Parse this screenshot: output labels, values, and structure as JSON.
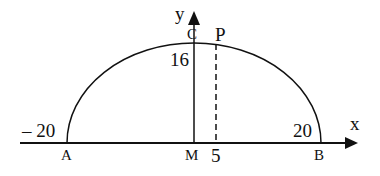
{
  "diagram": {
    "type": "semi-ellipse-on-axes",
    "axes": {
      "x_label": "x",
      "y_label": "y"
    },
    "points": {
      "A": "A",
      "B": "B",
      "C": "C",
      "M": "M",
      "P": "P"
    },
    "values": {
      "neg_twenty": "– 20",
      "twenty": "20",
      "sixteen": "16",
      "five": "5"
    },
    "semi_axis_x": 20,
    "semi_axis_y": 16,
    "p_x": 5
  }
}
